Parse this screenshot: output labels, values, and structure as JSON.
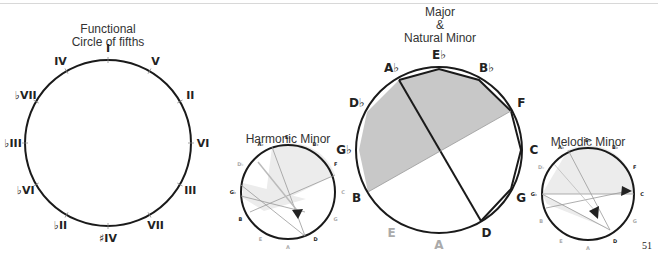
{
  "titles": {
    "functional": [
      "Functional",
      "Circle of fifths"
    ],
    "major": [
      "Major",
      "&",
      "Natural Minor"
    ],
    "harmonic": "Harmonic Minor",
    "melodic": "Melodic Minor"
  },
  "functional_circle": {
    "labels": [
      "I",
      "V",
      "II",
      "VI",
      "III",
      "VII",
      "♯IV",
      "♭II",
      "♭VI",
      "♭III",
      "♭VII",
      "IV"
    ]
  },
  "major_circle": {
    "labels": [
      "E♭",
      "B♭",
      "F",
      "C",
      "G",
      "D",
      "A",
      "E",
      "B",
      "G♭",
      "D♭",
      "A♭"
    ],
    "gray_labels": [
      "A",
      "E"
    ]
  },
  "harmonic_circle": {
    "labels": [
      "E♭",
      "B♭",
      "F",
      "C",
      "G",
      "D",
      "A",
      "E",
      "B",
      "G♭",
      "D♭",
      "A♭"
    ]
  },
  "melodic_circle": {
    "labels": [
      "E♭",
      "B♭",
      "F",
      "C",
      "G",
      "D",
      "A",
      "E",
      "B",
      "G♭",
      "D♭",
      "A♭"
    ]
  },
  "page_number": "51",
  "colors": {
    "stroke": "#1a1a1a",
    "shade": "#c8c8c8",
    "light_shade": "#ececec",
    "thin_line": "#999999"
  }
}
